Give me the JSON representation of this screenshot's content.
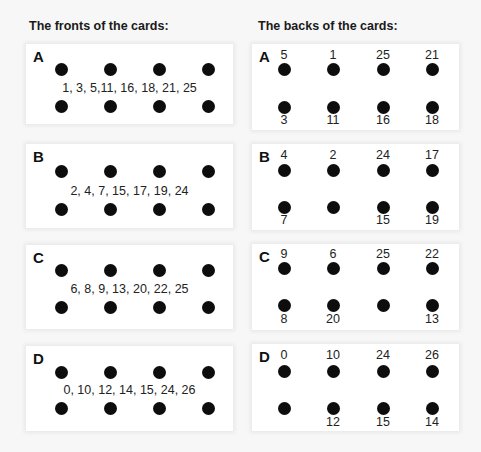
{
  "headings": {
    "fronts": "The fronts of the cards:",
    "backs": "The backs of the cards:"
  },
  "fronts": [
    {
      "letter": "A",
      "numbers": "1, 3, 5,11, 16, 18, 21, 25"
    },
    {
      "letter": "B",
      "numbers": "2, 4, 7, 15, 17, 19, 24"
    },
    {
      "letter": "C",
      "numbers": "6, 8, 9, 13, 20, 22, 25"
    },
    {
      "letter": "D",
      "numbers": "0, 10, 12, 14, 15, 24, 26"
    }
  ],
  "backs": [
    {
      "letter": "A",
      "top": [
        "5",
        "1",
        "25",
        "21"
      ],
      "bottom": [
        "3",
        "11",
        "16",
        "18"
      ]
    },
    {
      "letter": "B",
      "top": [
        "4",
        "2",
        "24",
        "17"
      ],
      "bottom": [
        "7",
        "",
        "15",
        "19"
      ]
    },
    {
      "letter": "C",
      "top": [
        "9",
        "6",
        "25",
        "22"
      ],
      "bottom": [
        "8",
        "20",
        "",
        "13"
      ]
    },
    {
      "letter": "D",
      "top": [
        "0",
        "10",
        "24",
        "26"
      ],
      "bottom": [
        "",
        "12",
        "15",
        "14"
      ]
    }
  ]
}
